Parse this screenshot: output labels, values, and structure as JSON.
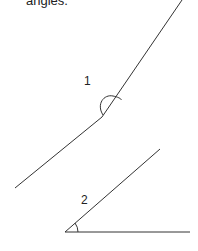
{
  "caption": "angles.",
  "diagram": {
    "angles": [
      {
        "label": "1",
        "type": "obtuse",
        "vertex": [
          102,
          117
        ],
        "rays": [
          [
            182,
            0
          ],
          [
            15,
            188
          ]
        ]
      },
      {
        "label": "2",
        "type": "acute",
        "vertex": [
          65,
          232
        ],
        "rays": [
          [
            160,
            149
          ],
          [
            190,
            232
          ]
        ]
      }
    ],
    "line_color": "#333333"
  }
}
